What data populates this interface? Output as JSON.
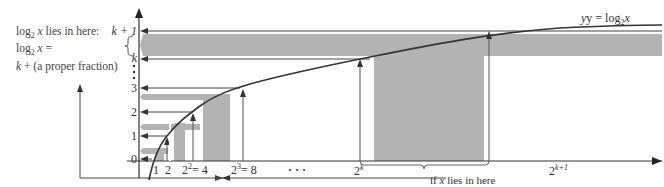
{
  "figure": {
    "curve_label_prefix": "y = log",
    "curve_label_base": "2",
    "curve_label_var": "x",
    "note": {
      "line1_prefix": "log",
      "line1_base": "2",
      "line1_var": "x",
      "line1_suffix": " lies in here:",
      "line2_prefix": "log",
      "line2_base": "2",
      "line2_var": "x",
      "line2_suffix": " =",
      "line3_var": "k",
      "line3_suffix": " + (a proper fraction)"
    },
    "y_ticks": {
      "k_plus_1": "k + 1",
      "k": "k",
      "t3": "3",
      "t2": "2",
      "t1": "1",
      "t0": "0"
    },
    "x_ticks": {
      "t1": "1",
      "t2": "2",
      "t4_base": "2",
      "t4_exp": "2",
      "t4_eq": "= 4",
      "t8_base": "2",
      "t8_exp": "3",
      "t8_eq": "= 8",
      "ellipsis": "· · ·",
      "tk_base": "2",
      "tk_exp": "k",
      "tk1_base": "2",
      "tk1_exp": "k+1"
    },
    "bottom_note_prefix": "if ",
    "bottom_note_var": "x",
    "bottom_note_suffix": " lies in here",
    "colors": {
      "shade": "#b3b3b3",
      "line": "#444444",
      "curve": "#333333"
    }
  }
}
